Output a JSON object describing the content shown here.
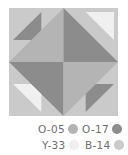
{
  "palette": {
    "O-05": "#b4b4b4",
    "O-17": "#8c8c8c",
    "Y-33": "#f0f0f0",
    "B-14": "#cacaca"
  },
  "legend": [
    {
      "label": "O-05",
      "color": "#b4b4b4"
    },
    {
      "label": "O-17",
      "color": "#8c8c8c"
    },
    {
      "label": "Y-33",
      "color": "#f0f0f0"
    },
    {
      "label": "B-14",
      "color": "#cacaca"
    }
  ],
  "block": {
    "background": "B-14",
    "diamond_quadrants": {
      "upper_left": "O-05",
      "upper_right": "O-17",
      "lower_left": "O-17",
      "lower_right": "O-05"
    },
    "corner_triangles": {
      "top_left": "O-17",
      "top_right": "Y-33",
      "bottom_left": "Y-33",
      "bottom_right": "O-17"
    }
  }
}
